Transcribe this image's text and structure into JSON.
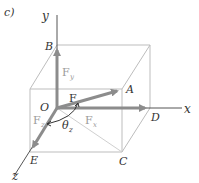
{
  "figure_label": "c)",
  "axes": {
    "x": "x",
    "y": "y",
    "z": "z"
  },
  "points": {
    "O": "O",
    "A": "A",
    "B": "B",
    "C": "C",
    "D": "D",
    "E": "E"
  },
  "vectors": {
    "F": "F",
    "Fx": "F",
    "Fx_sub": "x",
    "Fy": "F",
    "Fy_sub": "y",
    "Fz": "F",
    "Fz_sub": "z"
  },
  "angle": {
    "symbol": "θ",
    "sub": "z"
  },
  "colors": {
    "box": "#bdbdbd",
    "axis": "#555555",
    "vector": "#8c8c8c",
    "text": "#333333"
  }
}
